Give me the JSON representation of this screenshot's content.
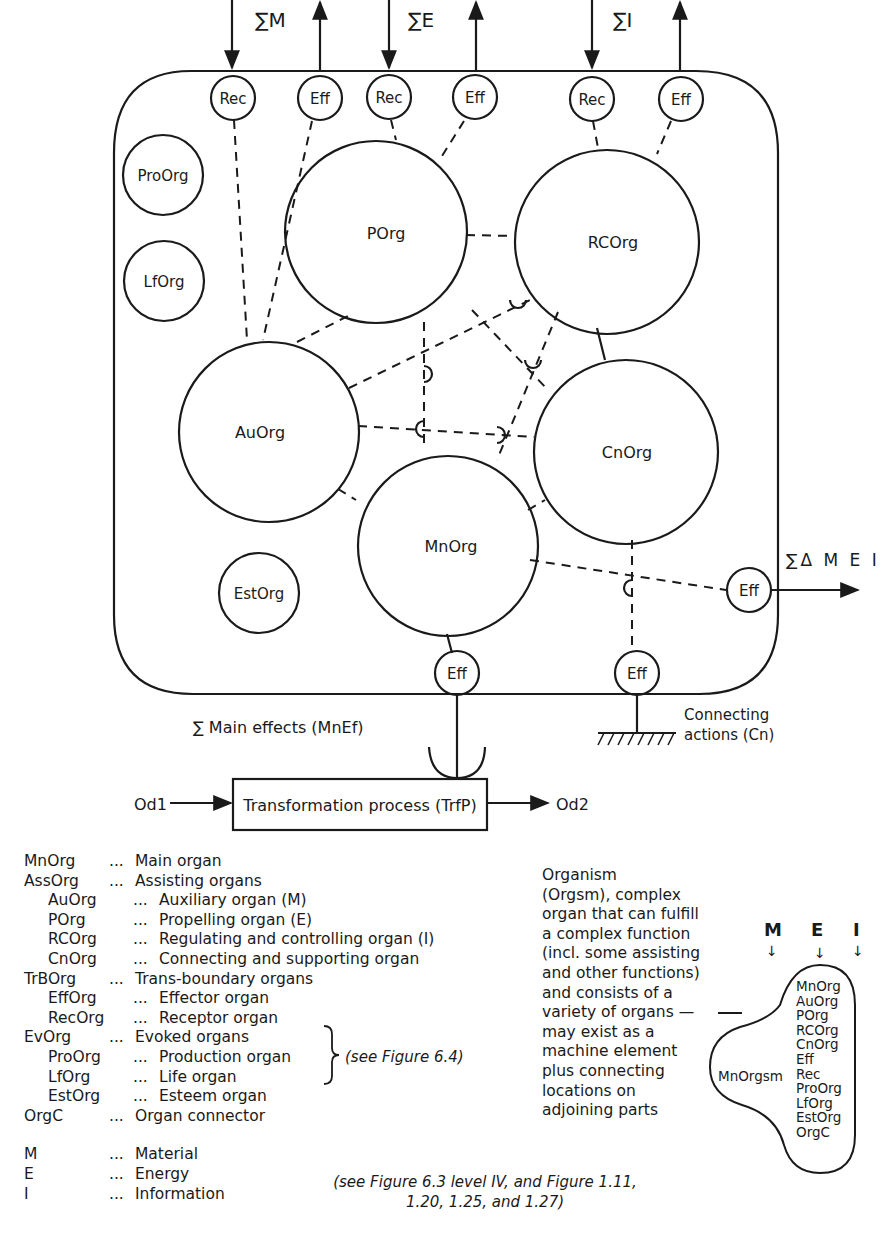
{
  "diagram": {
    "inputs": [
      {
        "label": "∑M",
        "receptor": "Rec",
        "effector": "Eff"
      },
      {
        "label": "∑E",
        "receptor": "Rec",
        "effector": "Eff"
      },
      {
        "label": "∑I",
        "receptor": "Rec",
        "effector": "Eff"
      }
    ],
    "organs": {
      "pro": "ProOrg",
      "lf": "LfOrg",
      "est": "EstOrg",
      "p": "POrg",
      "rc": "RCOrg",
      "au": "AuOrg",
      "cn": "CnOrg",
      "mn": "MnOrg"
    },
    "effectors": {
      "bottom_main": "Eff",
      "bottom_conn": "Eff",
      "right": "Eff"
    },
    "right_output_label": "∑Δ M E I",
    "main_effects_label": "∑ Main  effects  (MnEf)",
    "connecting_label_1": "Connecting",
    "connecting_label_2": "actions  (Cn)",
    "process_label": "Transformation  process  (TrfP)",
    "operand_in": "Od1",
    "operand_out": "Od2"
  },
  "legend": {
    "rows": [
      {
        "abbr": "MnOrg",
        "dots": "...",
        "desc": "Main  organ",
        "sub": false
      },
      {
        "abbr": "AssOrg",
        "dots": "...",
        "desc": "Assisting  organs",
        "sub": false
      },
      {
        "abbr": "AuOrg",
        "dots": "...",
        "desc": "Auxiliary  organ  (M)",
        "sub": true
      },
      {
        "abbr": "POrg",
        "dots": "...",
        "desc": "Propelling  organ  (E)",
        "sub": true
      },
      {
        "abbr": "RCOrg",
        "dots": "...",
        "desc": "Regulating  and  controlling  organ  (I)",
        "sub": true
      },
      {
        "abbr": "CnOrg",
        "dots": "...",
        "desc": "Connecting  and  supporting  organ",
        "sub": true
      },
      {
        "abbr": "TrBOrg",
        "dots": "...",
        "desc": "Trans-boundary  organs",
        "sub": false
      },
      {
        "abbr": "EffOrg",
        "dots": "...",
        "desc": "Effector  organ",
        "sub": true
      },
      {
        "abbr": "RecOrg",
        "dots": "...",
        "desc": "Receptor  organ",
        "sub": true
      },
      {
        "abbr": "EvOrg",
        "dots": "...",
        "desc": "Evoked  organs",
        "sub": false
      },
      {
        "abbr": "ProOrg",
        "dots": "...",
        "desc": "Production  organ",
        "sub": true
      },
      {
        "abbr": "LfOrg",
        "dots": "...",
        "desc": "Life  organ",
        "sub": true
      },
      {
        "abbr": "EstOrg",
        "dots": "...",
        "desc": "Esteem  organ",
        "sub": true
      },
      {
        "abbr": "OrgC",
        "dots": "...",
        "desc": "Organ  connector",
        "sub": false
      },
      {
        "abbr": "",
        "dots": "",
        "desc": "",
        "sub": false
      },
      {
        "abbr": "M",
        "dots": "...",
        "desc": "Material",
        "sub": false
      },
      {
        "abbr": "E",
        "dots": "...",
        "desc": "Energy",
        "sub": false
      },
      {
        "abbr": "I",
        "dots": "...",
        "desc": "Information",
        "sub": false
      }
    ],
    "brace_note": "(see  Figure  6.4)",
    "bottom_note_1": "(see  Figure 6.3  level  IV,  and  Figure 1.11,",
    "bottom_note_2": "1.20,  1.25,  and  1.27)"
  },
  "organism": {
    "description_lines": [
      "Organism",
      "(Orgsm),  complex",
      "organ  that  can  fulfill",
      "a  complex  function",
      "(incl.  some  assisting",
      "and  other  functions)",
      "and  consists  of  a",
      "variety  of  organs  —",
      "may  exist  as  a",
      "machine  element",
      "plus  connecting",
      "locations  on",
      "adjoining  parts"
    ],
    "inputs": [
      "M",
      "E",
      "I"
    ],
    "arrow": "↓",
    "label": "MnOrgsm",
    "members": [
      "MnOrg",
      "AuOrg",
      "POrg",
      "RCOrg",
      "CnOrg",
      "Eff",
      "Rec",
      "ProOrg",
      "LfOrg",
      "EstOrg",
      "OrgC"
    ]
  }
}
